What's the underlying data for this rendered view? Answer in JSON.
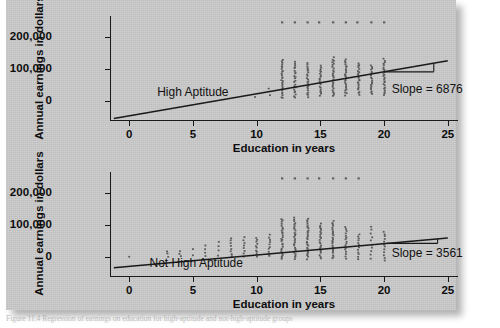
{
  "figure": {
    "caption": "Figure 11.4   Regression of earnings on education for high-aptitude and not-high-aptitude groups",
    "background_color": "#c9c9c9",
    "ink_color": "#1a1a1a",
    "point_color": "#5a5a5a"
  },
  "chart_data": [
    {
      "type": "scatter",
      "panel_id": "high-aptitude",
      "title": "High Aptitude",
      "xlabel": "Education in years",
      "ylabel": "Annual earnings in dollars",
      "xlim": [
        -1.5,
        25.8
      ],
      "ylim": [
        -60000,
        265000
      ],
      "xticks": [
        0,
        5,
        10,
        15,
        20,
        25
      ],
      "xticklabels": [
        "0",
        "5",
        "10",
        "15",
        "20",
        "25"
      ],
      "yticks": [
        0,
        100000,
        200000
      ],
      "yticklabels": [
        "0",
        "100,000",
        "200,000"
      ],
      "grid": false,
      "legend": null,
      "annotations": [
        {
          "text": "High Aptitude",
          "x": 2.2,
          "y": 28000
        },
        {
          "text": "Slope = 6876",
          "x": 20.6,
          "y": 36000
        }
      ],
      "regression": {
        "slope": 6876,
        "intercept": -47000,
        "x_start": -1.2,
        "x_end": 25.0,
        "label": "Slope = 6876"
      },
      "slope_bracket": {
        "x_left": 20.0,
        "x_right": 23.9,
        "y_top": 96000,
        "y_drop": 70000
      },
      "capped_row": {
        "y": 245000,
        "x": [
          12.0,
          13.0,
          14.0,
          14.9,
          16.0,
          17.0,
          17.9,
          19.0,
          20.0
        ]
      },
      "columns": [
        {
          "x": 9.9,
          "n": 1,
          "y_min": 12000,
          "y_max": 12000
        },
        {
          "x": 11.0,
          "n": 2,
          "y_min": 18000,
          "y_max": 40000
        },
        {
          "x": 12.0,
          "n": 26,
          "y_min": 8000,
          "y_max": 128000
        },
        {
          "x": 13.0,
          "n": 22,
          "y_min": 10000,
          "y_max": 122000
        },
        {
          "x": 14.0,
          "n": 22,
          "y_min": 12000,
          "y_max": 118000
        },
        {
          "x": 15.0,
          "n": 20,
          "y_min": 16000,
          "y_max": 110000
        },
        {
          "x": 16.0,
          "n": 26,
          "y_min": 14000,
          "y_max": 135000
        },
        {
          "x": 17.0,
          "n": 24,
          "y_min": 18000,
          "y_max": 128000
        },
        {
          "x": 18.0,
          "n": 22,
          "y_min": 20000,
          "y_max": 118000
        },
        {
          "x": 19.0,
          "n": 20,
          "y_min": 22000,
          "y_max": 110000
        },
        {
          "x": 20.0,
          "n": 24,
          "y_min": 18000,
          "y_max": 130000
        }
      ]
    },
    {
      "type": "scatter",
      "panel_id": "not-high-aptitude",
      "title": "Not High Aptitude",
      "xlabel": "Education in years",
      "ylabel": "Annual earnings in dollars",
      "xlim": [
        -1.5,
        25.8
      ],
      "ylim": [
        -60000,
        265000
      ],
      "xticks": [
        0,
        5,
        10,
        15,
        20,
        25
      ],
      "xticklabels": [
        "0",
        "5",
        "10",
        "15",
        "20",
        "25"
      ],
      "yticks": [
        0,
        100000,
        200000
      ],
      "yticklabels": [
        "0",
        "100,000",
        "200,000"
      ],
      "grid": false,
      "legend": null,
      "annotations": [
        {
          "text": "Not High Aptitude",
          "x": 1.6,
          "y": -20000
        },
        {
          "text": "Slope = 3561",
          "x": 20.6,
          "y": 12000
        }
      ],
      "regression": {
        "slope": 3561,
        "intercept": -30000,
        "x_start": -1.2,
        "x_end": 25.0,
        "label": "Slope = 3561"
      },
      "slope_bracket": {
        "x_left": 20.2,
        "x_right": 24.2,
        "y_top": 55000,
        "y_drop": 40000
      },
      "capped_row": {
        "y": 245000,
        "x": [
          12.0,
          13.0,
          14.0,
          14.9,
          16.0,
          17.0,
          18.0
        ]
      },
      "columns": [
        {
          "x": 0.0,
          "n": 1,
          "y_min": 2000,
          "y_max": 2000
        },
        {
          "x": 3.0,
          "n": 3,
          "y_min": 2000,
          "y_max": 16000
        },
        {
          "x": 4.0,
          "n": 3,
          "y_min": 2000,
          "y_max": 18000
        },
        {
          "x": 5.0,
          "n": 2,
          "y_min": 6000,
          "y_max": 26000
        },
        {
          "x": 6.0,
          "n": 4,
          "y_min": 2000,
          "y_max": 34000
        },
        {
          "x": 7.0,
          "n": 4,
          "y_min": 4000,
          "y_max": 48000
        },
        {
          "x": 8.0,
          "n": 8,
          "y_min": 2000,
          "y_max": 58000
        },
        {
          "x": 9.0,
          "n": 8,
          "y_min": 2000,
          "y_max": 62000
        },
        {
          "x": 10.0,
          "n": 10,
          "y_min": 2000,
          "y_max": 60000
        },
        {
          "x": 11.0,
          "n": 10,
          "y_min": 2000,
          "y_max": 68000
        },
        {
          "x": 12.0,
          "n": 26,
          "y_min": -8000,
          "y_max": 118000
        },
        {
          "x": 13.0,
          "n": 26,
          "y_min": -6000,
          "y_max": 122000
        },
        {
          "x": 14.0,
          "n": 26,
          "y_min": -6000,
          "y_max": 118000
        },
        {
          "x": 15.0,
          "n": 22,
          "y_min": -4000,
          "y_max": 104000
        },
        {
          "x": 16.0,
          "n": 24,
          "y_min": -4000,
          "y_max": 112000
        },
        {
          "x": 17.0,
          "n": 16,
          "y_min": -4000,
          "y_max": 92000
        },
        {
          "x": 18.0,
          "n": 12,
          "y_min": -8000,
          "y_max": 72000
        },
        {
          "x": 19.0,
          "n": 10,
          "y_min": -6000,
          "y_max": 96000
        },
        {
          "x": 20.0,
          "n": 12,
          "y_min": -10000,
          "y_max": 80000
        }
      ]
    }
  ]
}
